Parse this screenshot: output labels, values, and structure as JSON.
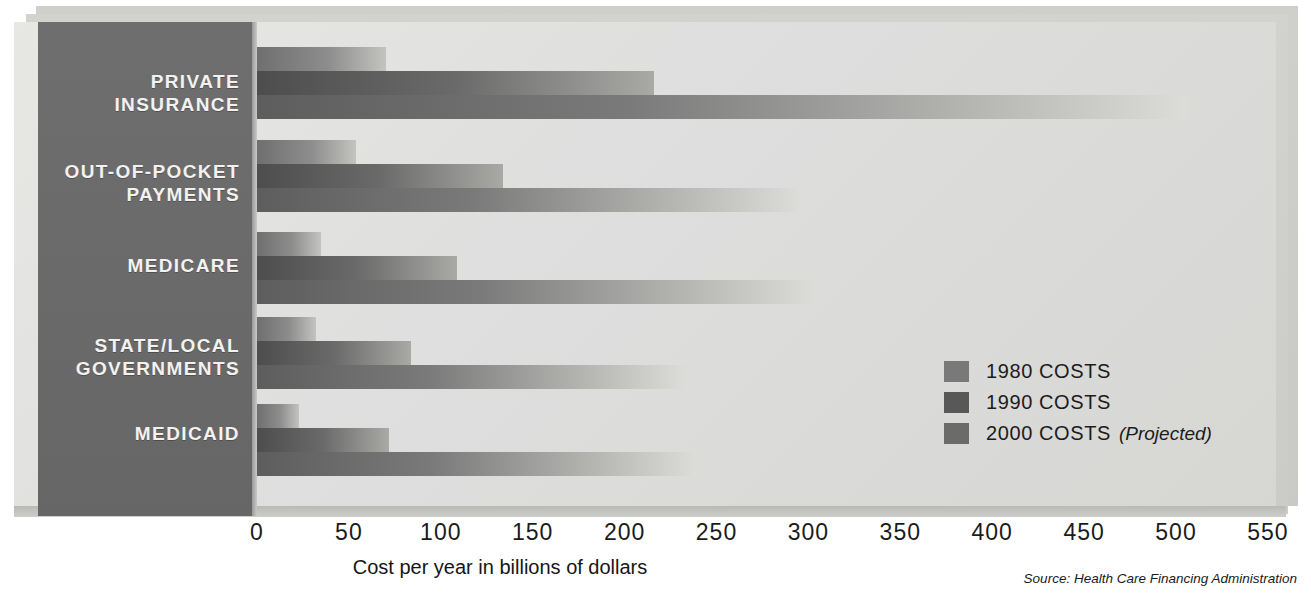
{
  "chart_data": {
    "type": "bar",
    "orientation": "horizontal",
    "title": "",
    "xlabel": "Cost per year in billions of dollars",
    "ylabel": "",
    "xlim": [
      0,
      550
    ],
    "xticks": [
      "0",
      "50",
      "100",
      "150",
      "200",
      "250",
      "300",
      "350",
      "400",
      "450",
      "500",
      "550"
    ],
    "grid": false,
    "legend_position": "inside-right",
    "categories": [
      "PRIVATE INSURANCE",
      "OUT-OF-POCKET PAYMENTS",
      "MEDICARE",
      "STATE/LOCAL GOVERNMENTS",
      "MEDICAID"
    ],
    "series": [
      {
        "name": "1980 COSTS",
        "values": [
          70,
          54,
          35,
          32,
          23
        ],
        "color": "#797979"
      },
      {
        "name": "1990 COSTS",
        "values": [
          216,
          134,
          109,
          84,
          72
        ],
        "color": "#585858"
      },
      {
        "name": "2000 COSTS",
        "values": [
          506,
          295,
          303,
          233,
          239
        ],
        "color": "#6b6b6b"
      }
    ],
    "annotations": [
      "Source: Health Care Financing Administration"
    ]
  },
  "categories": [
    {
      "line1": "PRIVATE",
      "line2": "INSURANCE"
    },
    {
      "line1": "OUT-OF-POCKET",
      "line2": "PAYMENTS"
    },
    {
      "line1": "MEDICARE",
      "line2": ""
    },
    {
      "line1": "STATE/LOCAL",
      "line2": "GOVERNMENTS"
    },
    {
      "line1": "MEDICAID",
      "line2": ""
    }
  ],
  "legend": {
    "items": [
      {
        "label": "1980 COSTS",
        "note": ""
      },
      {
        "label": "1990 COSTS",
        "note": ""
      },
      {
        "label": "2000 COSTS",
        "note": "(Projected)"
      }
    ]
  },
  "axis": {
    "title": "Cost per year in billions of dollars",
    "ticks": [
      "0",
      "50",
      "100",
      "150",
      "200",
      "250",
      "300",
      "350",
      "400",
      "450",
      "500",
      "550"
    ]
  },
  "source": "Source: Health Care Financing Administration",
  "colors": {
    "panel": "#dedede",
    "label_panel": "#6a6a6a",
    "series_1980": "#797979",
    "series_1990": "#585858",
    "series_2000": "#6b6b6b",
    "text_dark": "#1b1b1b",
    "text_light": "#f2f2f0"
  }
}
